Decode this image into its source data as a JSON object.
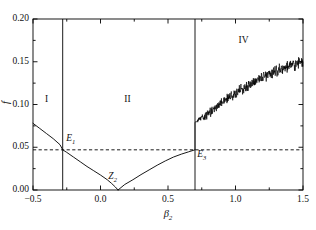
{
  "chart_data": {
    "type": "line",
    "title": "",
    "subtitle": "",
    "xlabel": "β₂",
    "ylabel": "f",
    "xlim": [
      -0.5,
      1.5
    ],
    "ylim": [
      0.0,
      0.2
    ],
    "xticks": [
      -0.5,
      0.0,
      0.5,
      1.0,
      1.5
    ],
    "xticklabels": [
      "−0.5",
      "0.0",
      "0.5",
      "1.0",
      "1.5"
    ],
    "yticks": [
      0.0,
      0.05,
      0.1,
      0.15,
      0.2
    ],
    "yticklabels": [
      "0.00",
      "0.05",
      "0.10",
      "0.15",
      "0.20"
    ],
    "xminorticks": [
      -0.25,
      0.25,
      0.75,
      1.25
    ],
    "yminorticks": [
      0.025,
      0.075,
      0.125,
      0.175
    ],
    "grid": false,
    "legend": null,
    "line_color": "#000000",
    "series": [
      {
        "name": "branch-descending",
        "comment": "smooth branch falling from left edge to zero at Z2",
        "points": [
          [
            -0.5,
            0.078
          ],
          [
            -0.45,
            0.072
          ],
          [
            -0.4,
            0.066
          ],
          [
            -0.35,
            0.06
          ],
          [
            -0.3,
            0.053
          ],
          [
            -0.28,
            0.047
          ],
          [
            -0.25,
            0.044
          ],
          [
            -0.2,
            0.0385
          ],
          [
            -0.15,
            0.033
          ],
          [
            -0.1,
            0.0275
          ],
          [
            -0.05,
            0.0225
          ],
          [
            0.0,
            0.0175
          ],
          [
            0.05,
            0.012
          ],
          [
            0.08,
            0.008
          ],
          [
            0.11,
            0.0035
          ],
          [
            0.13,
            0.0
          ]
        ]
      },
      {
        "name": "branch-ascending",
        "comment": "smooth branch rising from Z2 to E3 where chaos begins",
        "points": [
          [
            0.13,
            0.0
          ],
          [
            0.18,
            0.0065
          ],
          [
            0.24,
            0.012
          ],
          [
            0.3,
            0.018
          ],
          [
            0.36,
            0.0235
          ],
          [
            0.42,
            0.029
          ],
          [
            0.48,
            0.034
          ],
          [
            0.54,
            0.0385
          ],
          [
            0.6,
            0.042
          ],
          [
            0.65,
            0.0445
          ],
          [
            0.7,
            0.047
          ]
        ]
      },
      {
        "name": "chaotic-band",
        "comment": "noisy chaotic attractor band after E3, mean trend with jitter",
        "trend": [
          [
            0.7,
            0.079
          ],
          [
            0.75,
            0.085
          ],
          [
            0.8,
            0.09
          ],
          [
            0.85,
            0.096
          ],
          [
            0.9,
            0.102
          ],
          [
            0.95,
            0.108
          ],
          [
            1.0,
            0.113
          ],
          [
            1.05,
            0.118
          ],
          [
            1.1,
            0.123
          ],
          [
            1.15,
            0.128
          ],
          [
            1.2,
            0.132
          ],
          [
            1.25,
            0.136
          ],
          [
            1.3,
            0.1395
          ],
          [
            1.35,
            0.1425
          ],
          [
            1.4,
            0.145
          ],
          [
            1.45,
            0.1475
          ],
          [
            1.5,
            0.1495
          ]
        ],
        "noise_amplitude": 0.009,
        "lower_spike_x": 0.7,
        "lower_spike_y": 0.047
      }
    ],
    "annotations": [
      {
        "name": "region-I",
        "label": "I",
        "x": -0.4,
        "y": 0.104
      },
      {
        "name": "region-II",
        "label": "II",
        "x": 0.2,
        "y": 0.104
      },
      {
        "name": "region-IV",
        "label": "IV",
        "x": 1.06,
        "y": 0.173
      },
      {
        "name": "point-E1",
        "label": "E",
        "sub": "1",
        "x": -0.22,
        "y": 0.058
      },
      {
        "name": "point-Z2",
        "label": "Z",
        "sub": "2",
        "x": 0.09,
        "y": 0.014
      },
      {
        "name": "point-E3",
        "label": "E",
        "sub": "3",
        "x": 0.75,
        "y": 0.04
      }
    ],
    "hlines": [
      {
        "name": "threshold-line",
        "y": 0.047,
        "style": "dashed",
        "color": "#000000"
      }
    ],
    "vlines": [
      {
        "name": "boundary-I-II",
        "x": -0.28,
        "style": "solid",
        "color": "#000000"
      },
      {
        "name": "boundary-II-IV",
        "x": 0.7,
        "style": "solid",
        "color": "#000000"
      }
    ]
  },
  "axes": {
    "xlabel": "β",
    "xlabel_sub": "2",
    "ylabel": "f"
  }
}
